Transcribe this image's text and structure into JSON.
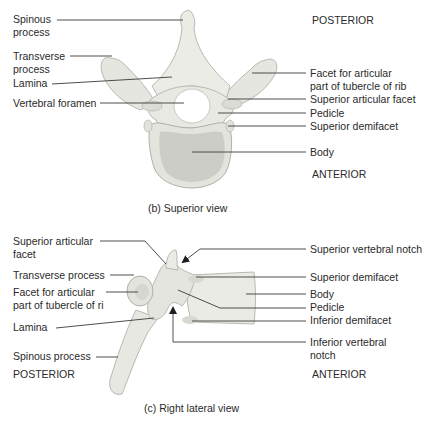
{
  "superior_view": {
    "caption": "(b) Superior view",
    "orientation": {
      "top": "POSTERIOR",
      "bottom": "ANTERIOR"
    },
    "left_labels": [
      {
        "line1": "Spinous",
        "line2": "process"
      },
      {
        "line1": "Transverse",
        "line2": "process"
      },
      {
        "line1": "Lamina",
        "line2": ""
      },
      {
        "line1": "Vertebral foramen",
        "line2": ""
      }
    ],
    "right_labels": [
      {
        "line1": "Facet for articular",
        "line2": "part of tubercle of rib"
      },
      {
        "line1": "Superior articular facet",
        "line2": ""
      },
      {
        "line1": "Pedicle",
        "line2": ""
      },
      {
        "line1": "Superior demifacet",
        "line2": ""
      },
      {
        "line1": "Body",
        "line2": ""
      }
    ]
  },
  "lateral_view": {
    "caption": "(c) Right lateral view",
    "orientation": {
      "left": "POSTERIOR",
      "right": "ANTERIOR"
    },
    "left_labels": [
      {
        "line1": "Superior articular",
        "line2": "facet"
      },
      {
        "line1": "Transverse process",
        "line2": ""
      },
      {
        "line1": "Facet for articular",
        "line2": "part of tubercle of ri"
      },
      {
        "line1": "Lamina",
        "line2": ""
      },
      {
        "line1": "Spinous process",
        "line2": ""
      }
    ],
    "right_labels": [
      {
        "line1": "Superior vertebral notch",
        "line2": ""
      },
      {
        "line1": "Superior demifacet",
        "line2": ""
      },
      {
        "line1": "Body",
        "line2": ""
      },
      {
        "line1": "Pedicle",
        "line2": ""
      },
      {
        "line1": "Inferior demifacet",
        "line2": ""
      },
      {
        "line1": "Inferior vertebral",
        "line2": "notch"
      }
    ]
  },
  "colors": {
    "bone_fill": "#ebebe6",
    "bone_shade": "#d5d5cf",
    "bone_outline": "#b9b9b2",
    "body_surface": "#c9c9c4",
    "leader_line": "#3a3a3a",
    "text": "#2a2a2a"
  }
}
